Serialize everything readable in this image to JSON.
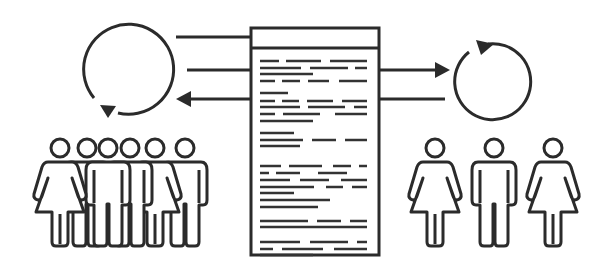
{
  "diagram": {
    "stroke_color": "#2b2b2b",
    "background_color": "#ffffff",
    "left_group": {
      "label": "",
      "people": [
        "woman",
        "man",
        "man",
        "woman",
        "man",
        "man"
      ],
      "cycle": "counter-clockwise"
    },
    "right_group": {
      "label": "",
      "people": [
        "woman",
        "man",
        "woman"
      ],
      "cycle": "clockwise"
    },
    "document": {
      "label": "",
      "paragraph_count": 6
    },
    "connectors": {
      "left": [
        "line",
        "line",
        "arrow-out-to-left"
      ],
      "right": [
        "arrow-out-to-right",
        "line"
      ]
    }
  }
}
